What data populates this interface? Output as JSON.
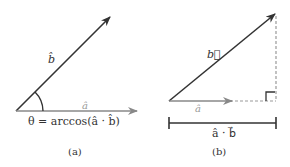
{
  "panel_a": {
    "caption": "(a)",
    "vector_b_label": "b̂",
    "vector_a_label": "â",
    "angle_formula": "θ = arccos(â · b̂)"
  },
  "panel_b": {
    "caption": "(b)",
    "vector_b_label": "b⃗",
    "vector_a_label": "â",
    "projection_label": "â · b⃗"
  },
  "colors": {
    "vector_b": "#333333",
    "vector_a": "#888888",
    "dashed": "#999999",
    "text": "#333333"
  }
}
